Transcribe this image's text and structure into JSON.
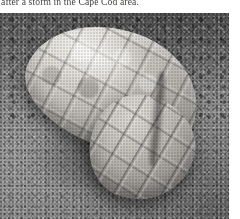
{
  "page": {
    "background_color": "#ffffff",
    "caption": {
      "text": "after a storm in the Cape Cod area.",
      "color": "#33312f",
      "clipped": "true"
    }
  },
  "photo": {
    "alt_description": "Grayscale photograph of a pale translucent segmented molted shell lying diagonally on grainy sand",
    "subject": "molted segmented shell carapace",
    "setting": "sand beach",
    "palette": {
      "sand_mid": "#999999",
      "sand_dark_gravel": "#757575",
      "shell_highlight": "#e8e5e0",
      "shell_midtone": "#c6c2bc",
      "shell_shadow": "#3a3a3a"
    }
  }
}
